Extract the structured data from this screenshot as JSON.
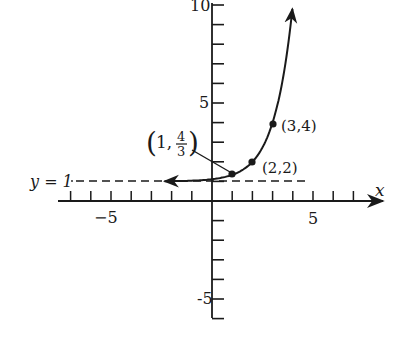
{
  "chart_data": {
    "type": "line",
    "title": "",
    "function": "y = 1 + 3^(x-2)",
    "xlabel": "x",
    "ylabel": "",
    "xlim": [
      -7.5,
      8.5
    ],
    "ylim": [
      -6,
      10.3
    ],
    "x_ticks": [
      -7,
      -6,
      -5,
      -4,
      -3,
      -2,
      -1,
      1,
      2,
      3,
      4,
      5,
      6,
      7
    ],
    "x_tick_labels": [
      {
        "value": -5,
        "label": "−5"
      },
      {
        "value": 5,
        "label": "5"
      }
    ],
    "y_ticks": [
      -6,
      -5,
      -4,
      -3,
      -2,
      -1,
      1,
      2,
      3,
      4,
      5,
      6,
      7,
      8,
      9,
      10
    ],
    "y_tick_labels": [
      {
        "value": 10,
        "label": "10"
      },
      {
        "value": 5,
        "label": "5"
      },
      {
        "value": -5,
        "label": "-5"
      }
    ],
    "grid": false,
    "series": [
      {
        "name": "exponential curve",
        "x": [
          -2.4,
          -1,
          0,
          1,
          2,
          3,
          3.5,
          4
        ],
        "y": [
          1.003,
          1.037,
          1.111,
          1.333,
          2,
          4,
          6.2,
          10
        ],
        "arrows": [
          "left",
          "up"
        ]
      }
    ],
    "points": [
      {
        "x": 1,
        "y": 1.3333,
        "label_main": "1,",
        "label_num": "4",
        "label_den": "3"
      },
      {
        "x": 2,
        "y": 2,
        "label": "(2,2)"
      },
      {
        "x": 3,
        "y": 4,
        "label": "(3,4)"
      }
    ],
    "asymptote": {
      "y": 1,
      "label": "y = 1",
      "style": "dashed"
    }
  },
  "labels": {
    "x_axis": "x",
    "asymptote": "y = 1",
    "tick_neg5_x": "−5",
    "tick_5_x": "5",
    "tick_10_y": "10",
    "tick_5_y": "5",
    "tick_neg5_y": "-5",
    "pt1_open": "(",
    "pt1_main": "1,",
    "pt1_num": "4",
    "pt1_den": "3",
    "pt1_close": ")",
    "pt2": "(2,2)",
    "pt3": "(3,4)"
  },
  "colors": {
    "ink": "#1a1a1a",
    "background": "#ffffff"
  }
}
